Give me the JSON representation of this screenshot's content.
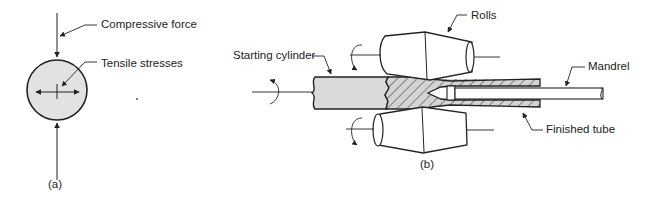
{
  "figure_a": {
    "caption": "(a)",
    "labels": {
      "compressive_force": "Compressive force",
      "tensile_stresses": "Tensile stresses"
    }
  },
  "figure_b": {
    "caption": "(b)",
    "labels": {
      "rolls": "Rolls",
      "starting_cylinder": "Starting cylinder",
      "mandrel": "Mandrel",
      "finished_tube": "Finished tube"
    }
  },
  "colors": {
    "line": "#222222",
    "fill_gray": "#d8d8d8",
    "hatch": "#555555"
  }
}
